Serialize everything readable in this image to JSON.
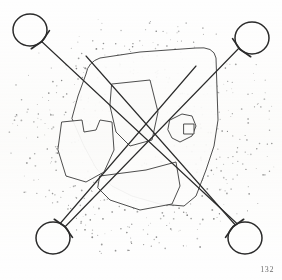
{
  "figure": {
    "page_number": "132",
    "caption": "",
    "ink_color": "#2b2b2b",
    "outline_color": "#3a3a3a",
    "stipple_color": "#7a7a7a",
    "paper_color": "#fefefe",
    "scale_note": ""
  },
  "markers": [
    {
      "id": "marker-top-left",
      "label": "",
      "cx": 30,
      "cy": 30,
      "rx": 17,
      "ry": 16,
      "arrow_angle_deg": 45
    },
    {
      "id": "marker-top-right",
      "label": "",
      "cx": 252,
      "cy": 38,
      "rx": 17,
      "ry": 16,
      "arrow_angle_deg": 135
    },
    {
      "id": "marker-bottom-left",
      "label": "",
      "cx": 53,
      "cy": 238,
      "rx": 17,
      "ry": 16,
      "arrow_angle_deg": 315
    },
    {
      "id": "marker-bottom-right",
      "label": "",
      "cx": 245,
      "cy": 238,
      "rx": 17,
      "ry": 16,
      "arrow_angle_deg": 225
    }
  ],
  "arrows": [
    {
      "id": "arrow-to-top-left",
      "from_x": 246,
      "from_y": 232,
      "to_x": 40,
      "to_y": 40,
      "head_at": "end"
    },
    {
      "id": "arrow-to-top-right",
      "from_x": 60,
      "from_y": 232,
      "to_x": 242,
      "to_y": 45,
      "head_at": "end"
    },
    {
      "id": "arrow-to-bottom-left",
      "from_x": 196,
      "from_y": 66,
      "to_x": 58,
      "to_y": 226,
      "head_at": "end"
    },
    {
      "id": "arrow-to-bottom-right",
      "from_x": 86,
      "from_y": 56,
      "to_x": 238,
      "to_y": 228,
      "head_at": "end"
    }
  ],
  "shapes": [
    {
      "id": "main-enclosure",
      "name": "main-enclosure-outline",
      "path": "M 72 118 L 78 96 L 86 74 Q 88 62 100 58 L 140 52 L 196 48 Q 214 46 216 58 L 218 120 L 214 146 L 206 170 L 196 196 L 184 206 L 160 204 L 132 196 L 112 186 L 96 168 L 84 146 Z"
    },
    {
      "id": "courtyard-north",
      "name": "inner-court-north",
      "path": "M 112 84 L 150 80 L 158 112 L 152 140 L 130 146 L 116 132 L 110 106 Z"
    },
    {
      "id": "room-block-west",
      "name": "inner-room-block-west",
      "path": "M 62 122 L 82 120 L 84 132 L 96 130 L 100 120 L 112 122 L 114 150 L 104 172 L 86 182 L 66 176 L 58 150 Z"
    },
    {
      "id": "hall-south",
      "name": "inner-hall-south",
      "path": "M 100 176 L 146 170 L 176 162 L 180 186 L 172 204 L 140 210 L 110 200 L 98 188 Z"
    },
    {
      "id": "structure-east",
      "name": "detailed-structure-east",
      "path": "M 170 120 L 182 114 L 192 116 L 196 126 L 192 136 L 180 142 L 172 138 L 168 130 Z"
    },
    {
      "id": "structure-east-room",
      "name": "detailed-structure-inner-room",
      "path": "M 184 124 L 194 124 L 194 134 L 184 134 Z"
    }
  ],
  "stipple": {
    "name": "excavation-stipple-field",
    "seed": 20137,
    "count": 1150,
    "bounds": {
      "x": 6,
      "y": 16,
      "width": 270,
      "height": 238
    },
    "dot_min_radius": 0.35,
    "dot_max_radius": 0.95
  }
}
